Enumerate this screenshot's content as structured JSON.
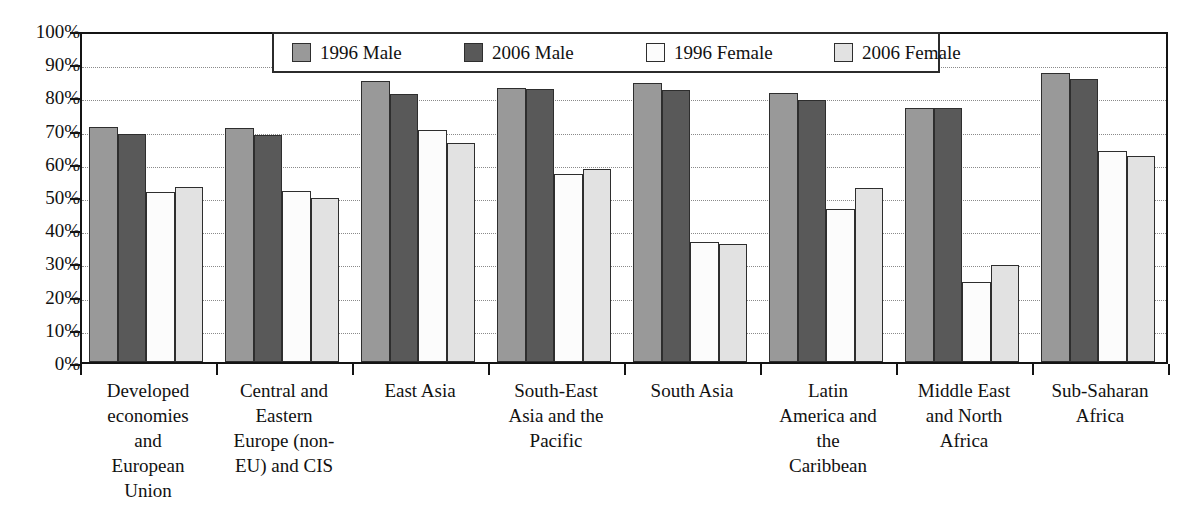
{
  "chart_data": {
    "type": "bar",
    "title": "",
    "subtitle": "",
    "xlabel": "",
    "ylabel": "",
    "ylim": [
      0,
      100
    ],
    "yunit": "%",
    "grid": true,
    "legend_position": "top-center",
    "ytick_labels": [
      "100%",
      "90%",
      "80%",
      "70%",
      "60%",
      "50%",
      "40%",
      "30%",
      "20%",
      "10%",
      "0%"
    ],
    "ytick_values": [
      100,
      90,
      80,
      70,
      60,
      50,
      40,
      30,
      20,
      10,
      0
    ],
    "categories": [
      "Developed economies and European Union",
      "Central and Eastern Europe (non-EU) and CIS",
      "East Asia",
      "South-East Asia and the Pacific",
      "South Asia",
      "Latin America and the Caribbean",
      "Middle East and North Africa",
      "Sub-Saharan Africa"
    ],
    "category_lines": [
      [
        "Developed",
        "economies",
        "and",
        "European",
        "Union"
      ],
      [
        "Central and",
        "Eastern",
        "Europe (non-",
        "EU) and CIS"
      ],
      [
        "East Asia"
      ],
      [
        "South-East",
        "Asia and the",
        "Pacific"
      ],
      [
        "South Asia"
      ],
      [
        "Latin",
        "America and",
        "the",
        "Caribbean"
      ],
      [
        "Middle East",
        "and North",
        "Africa"
      ],
      [
        "Sub-Saharan",
        "Africa"
      ]
    ],
    "series": [
      {
        "name": "1996 Male",
        "color": "#999999",
        "values": [
          70.8,
          70.5,
          84.5,
          82.5,
          84.0,
          81.0,
          76.5,
          87.0
        ]
      },
      {
        "name": "2006 Male",
        "color": "#595959",
        "values": [
          68.6,
          68.4,
          80.8,
          82.3,
          81.8,
          79.0,
          76.5,
          85.2
        ]
      },
      {
        "name": "1996 Female",
        "color": "#fcfcfc",
        "values": [
          51.3,
          51.6,
          70.0,
          56.5,
          36.0,
          46.0,
          24.2,
          63.5
        ]
      },
      {
        "name": "2006 Female",
        "color": "#e2e2e2",
        "values": [
          52.7,
          49.4,
          66.0,
          58.2,
          35.4,
          52.3,
          29.2,
          62.2
        ]
      }
    ]
  },
  "legend": {
    "items": [
      {
        "label": "1996 Male",
        "swatch_name": "legend-swatch-1996-male"
      },
      {
        "label": "2006 Male",
        "swatch_name": "legend-swatch-2006-male"
      },
      {
        "label": "1996 Female",
        "swatch_name": "legend-swatch-1996-female"
      },
      {
        "label": "2006 Female",
        "swatch_name": "legend-swatch-2006-female"
      }
    ]
  }
}
